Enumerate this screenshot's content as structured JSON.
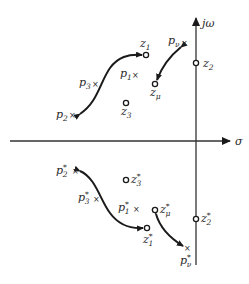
{
  "diagram": {
    "type": "pole-zero plot (s-plane)",
    "axes": {
      "horizontal_label": "σ",
      "vertical_label": "jω"
    },
    "upper_half": {
      "poles": [
        {
          "name": "p",
          "sub": "1",
          "sup": ""
        },
        {
          "name": "p",
          "sub": "2",
          "sup": ""
        },
        {
          "name": "p",
          "sub": "3",
          "sup": ""
        },
        {
          "name": "p",
          "sub": "ν",
          "sup": ""
        }
      ],
      "zeros": [
        {
          "name": "z",
          "sub": "1",
          "sup": ""
        },
        {
          "name": "z",
          "sub": "2",
          "sup": ""
        },
        {
          "name": "z",
          "sub": "3",
          "sup": ""
        },
        {
          "name": "z",
          "sub": "μ",
          "sup": ""
        }
      ]
    },
    "lower_half": {
      "poles": [
        {
          "name": "p",
          "sub": "1",
          "sup": "*"
        },
        {
          "name": "p",
          "sub": "2",
          "sup": "*"
        },
        {
          "name": "p",
          "sub": "3",
          "sup": "*"
        },
        {
          "name": "p",
          "sub": "ν",
          "sup": "*"
        }
      ],
      "zeros": [
        {
          "name": "z",
          "sub": "1",
          "sup": "*"
        },
        {
          "name": "z",
          "sub": "2",
          "sup": "*"
        },
        {
          "name": "z",
          "sub": "3",
          "sup": "*"
        },
        {
          "name": "z",
          "sub": "μ",
          "sup": "*"
        }
      ]
    },
    "arrows": [
      "p2 ↔ z1",
      "pν ↔ zμ",
      "p2* ↔ z1*",
      "zμ* ↔ pν*"
    ],
    "pole_marker": "×",
    "zero_marker": "o"
  }
}
